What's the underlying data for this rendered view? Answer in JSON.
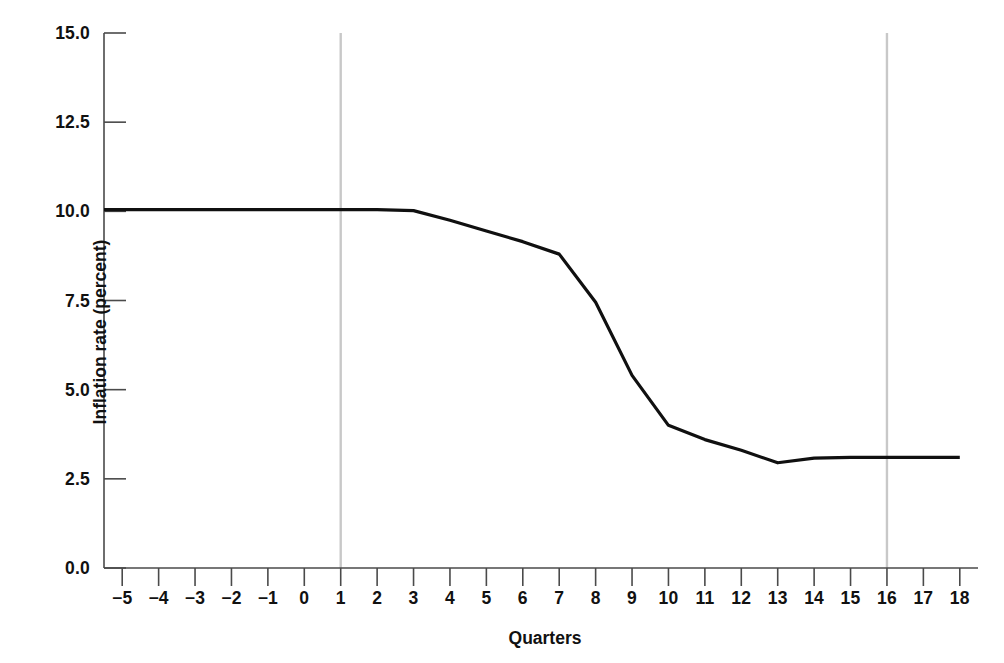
{
  "chart_data": {
    "type": "line",
    "title": "",
    "xlabel": "Quarters",
    "ylabel": "Inflation rate (percent)",
    "xlim": [
      -5.5,
      18.5
    ],
    "ylim": [
      0.0,
      15.0
    ],
    "grid": false,
    "legend": null,
    "x_ticks": [
      -5,
      -4,
      -3,
      -2,
      -1,
      0,
      1,
      2,
      3,
      4,
      5,
      6,
      7,
      8,
      9,
      10,
      11,
      12,
      13,
      14,
      15,
      16,
      17,
      18
    ],
    "x_tick_labels": [
      "−5",
      "−4",
      "−3",
      "−2",
      "−1",
      "0",
      "1",
      "2",
      "3",
      "4",
      "5",
      "6",
      "7",
      "8",
      "9",
      "10",
      "11",
      "12",
      "13",
      "14",
      "15",
      "16",
      "17",
      "18"
    ],
    "y_ticks": [
      0.0,
      2.5,
      5.0,
      7.5,
      10.0,
      12.5,
      15.0
    ],
    "y_tick_labels": [
      "0.0",
      "2.5",
      "5.0",
      "7.5",
      "10.0",
      "12.5",
      "15.0"
    ],
    "series": [
      {
        "name": "Inflation rate",
        "color": "#101010",
        "line_width": 3.2,
        "x": [
          -5.5,
          -5,
          -4,
          -3,
          -2,
          -1,
          0,
          1,
          2,
          3,
          4,
          5,
          6,
          7,
          8,
          9,
          10,
          11,
          12,
          13,
          14,
          15,
          16,
          17,
          18
        ],
        "y": [
          10.05,
          10.05,
          10.05,
          10.05,
          10.05,
          10.05,
          10.05,
          10.05,
          10.05,
          10.02,
          9.75,
          9.45,
          9.15,
          8.8,
          7.45,
          5.4,
          4.0,
          3.6,
          3.3,
          2.95,
          3.08,
          3.1,
          3.1,
          3.1,
          3.1
        ]
      }
    ],
    "vertical_reference_lines": [
      {
        "name": "quarter-1-marker",
        "x": 1,
        "color": "#c8c8c8",
        "width": 2.4
      },
      {
        "name": "quarter-16-marker",
        "x": 16,
        "color": "#c8c8c8",
        "width": 2.4
      }
    ],
    "axis_color": "#4a4a4a",
    "background": "#ffffff"
  }
}
